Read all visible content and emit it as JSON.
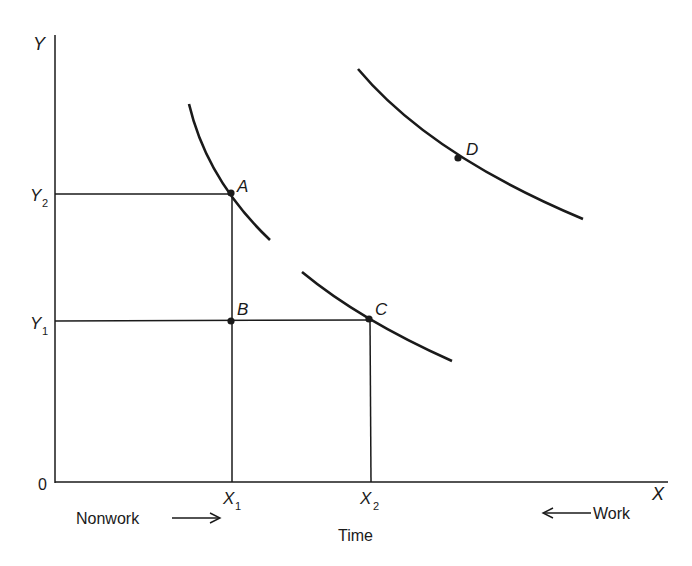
{
  "axes": {
    "y_label": "Y",
    "x_label": "X",
    "origin_label": "0",
    "y_ticks": [
      {
        "label": "Y",
        "sub": "2"
      },
      {
        "label": "Y",
        "sub": "1"
      }
    ],
    "x_ticks": [
      {
        "label": "X",
        "sub": "1"
      },
      {
        "label": "X",
        "sub": "2"
      }
    ],
    "x_title": "Time",
    "left_direction_label": "Nonwork",
    "right_direction_label": "Work",
    "left_arrow": "→",
    "right_arrow": "←"
  },
  "points": [
    {
      "label": "A"
    },
    {
      "label": "B"
    },
    {
      "label": "C"
    },
    {
      "label": "D"
    }
  ],
  "colors": {
    "ink": "#1a1a1a",
    "background": "#ffffff"
  }
}
